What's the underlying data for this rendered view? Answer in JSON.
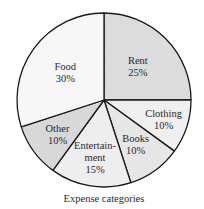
{
  "chart_data": {
    "type": "pie",
    "title": "",
    "caption": "Expense categories",
    "start_angle_deg": 0,
    "direction": "clockwise",
    "unit": "%",
    "categories": [
      "Rent",
      "Clothing",
      "Books",
      "Entertainment",
      "Other",
      "Food"
    ],
    "values": [
      25,
      10,
      10,
      15,
      10,
      30
    ],
    "slices": [
      {
        "name": "Rent",
        "value": 25,
        "label_lines": [
          "Rent",
          "25%"
        ],
        "color": "#dcdcdc"
      },
      {
        "name": "Clothing",
        "value": 10,
        "label_lines": [
          "Clothing",
          "10%"
        ],
        "color": "#efefef"
      },
      {
        "name": "Books",
        "value": 10,
        "label_lines": [
          "Books",
          "10%"
        ],
        "color": "#e6e6e6"
      },
      {
        "name": "Entertainment",
        "value": 15,
        "label_lines": [
          "Entertain-",
          "ment",
          "15%"
        ],
        "color": "#eeeeee"
      },
      {
        "name": "Other",
        "value": 10,
        "label_lines": [
          "Other",
          "10%"
        ],
        "color": "#d8d8d8"
      },
      {
        "name": "Food",
        "value": 30,
        "label_lines": [
          "Food",
          "30%"
        ],
        "color": "#f7f7f7"
      }
    ],
    "legend": "none",
    "grid": false
  }
}
